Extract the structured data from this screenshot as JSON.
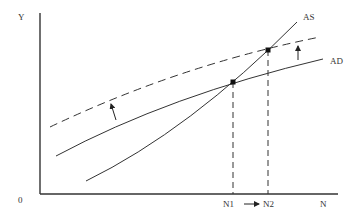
{
  "diagram": {
    "type": "economics AS-AD diagram",
    "axes": {
      "y_label": "Y",
      "x_label": "N",
      "origin_label": "0"
    },
    "curves": {
      "as_label": "AS",
      "ad_label": "AD"
    },
    "points": {
      "n1_label": "N1",
      "n2_label": "N2"
    },
    "shift_arrow_glyph": "→",
    "colors": {
      "line": "#333333",
      "background": "#ffffff"
    }
  }
}
